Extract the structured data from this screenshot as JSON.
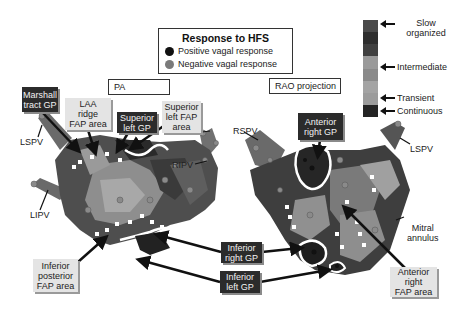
{
  "legend": {
    "title": "Response to HFS",
    "items": [
      {
        "label": "Positive vagal response",
        "color": "#111111"
      },
      {
        "label": "Negative vagal response",
        "color": "#7a7a7a"
      }
    ]
  },
  "colorbar": {
    "segments": [
      "#4a4a4a",
      "#2e2e2e",
      "#404040",
      "#9a9a9a",
      "#8a8a8a",
      "#a4a4a4",
      "#9c9c9c",
      "#242424"
    ],
    "labels": {
      "slow": "Slow\norganized",
      "intermediate": "Intermediate",
      "transient": "Transient",
      "continuous": "Continuous"
    }
  },
  "views": {
    "left": "PA",
    "right": "RAO projection"
  },
  "annotations": {
    "marshall": "Marshall\ntract GP",
    "laa": "LAA\nridge\nFAP area",
    "sup_left_gp": "Superior\nleft GP",
    "sup_left_fap": "Superior\nleft FAP\narea",
    "ant_right_gp": "Anterior\nright GP",
    "inf_right_gp": "Inferior\nright GP",
    "inf_left_gp": "Inferior\nleft GP",
    "inf_post_fap": "Inferior\nposterior\nFAP area",
    "ant_right_fap": "Anterior\nright\nFAP area"
  },
  "anatomy": {
    "lspv_left": "LSPV",
    "lipv": "LIPV",
    "rspv": "RSPV",
    "ripv": "RIPV",
    "lspv_right": "LSPV",
    "mitral": "Mitral\nannulus"
  }
}
